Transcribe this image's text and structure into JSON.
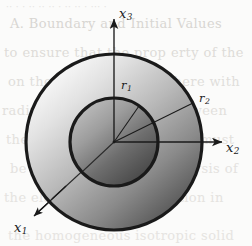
{
  "figure": {
    "background_color": "#fbfbfa",
    "stroke_color": "#1a1a1a",
    "axes": [
      {
        "name": "x3",
        "label": "x",
        "subscript": "3",
        "direction": "up"
      },
      {
        "name": "x2",
        "label": "x",
        "subscript": "2",
        "direction": "right"
      },
      {
        "name": "x1",
        "label": "x",
        "subscript": "1",
        "direction": "down-left"
      }
    ],
    "radii": [
      {
        "name": "r1",
        "label": "r",
        "subscript": "1",
        "value_px": 44,
        "describes": "inner circle radius"
      },
      {
        "name": "r2",
        "label": "r",
        "subscript": "2",
        "value_px": 88,
        "describes": "outer circle radius"
      }
    ],
    "circles": [
      {
        "name": "outer-circle",
        "center": [
          114,
          142
        ],
        "radius": 88,
        "stroke_width": 3.2,
        "fill_light": "#fdfdfd",
        "fill_dark": "#4f4f4f"
      },
      {
        "name": "inner-circle",
        "center": [
          114,
          142
        ],
        "radius": 44,
        "stroke_width": 3.2,
        "fill_light": "#b4b4b4",
        "fill_dark": "#454545"
      }
    ],
    "ghost_text": [
      "·· · ·  ··  ·· ·· ·  ·· ·· ·  ···  ·",
      "A. Boundary and Initial Values",
      "to ensure that the prop erty of the",
      "on the surface of the sphere with",
      "radius r and the region between",
      "the two concentric spheres must",
      "be considered for the analysis of",
      "the elastic wave propagation in",
      "the homogeneous isotropic solid"
    ]
  }
}
